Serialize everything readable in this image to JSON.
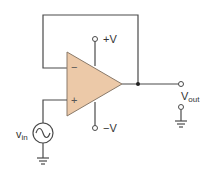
{
  "diagram": {
    "type": "circuit-schematic",
    "colors": {
      "opamp_fill": "#ecc9a8",
      "opamp_stroke": "#8a7a6a",
      "wire": "#4a4a4a"
    },
    "opamp": {
      "inverting_label": "−",
      "noninverting_label": "+"
    },
    "supply": {
      "positive_label": "+V",
      "negative_label": "−V"
    },
    "input": {
      "label": "v",
      "label_sub": "in",
      "source_icon": "ac-voltage-source"
    },
    "output": {
      "label": "V",
      "label_sub": "out"
    },
    "grounds": [
      "input-ground",
      "output-ground"
    ]
  }
}
